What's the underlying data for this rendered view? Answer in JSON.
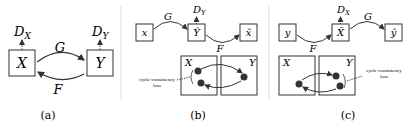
{
  "panels": [
    {
      "caption": "(a)",
      "nodes": {
        "x": "X",
        "y": "Y"
      },
      "discriminators": {
        "dx_base": "D",
        "dx_sub": "X",
        "dy_base": "D",
        "dy_sub": "Y"
      },
      "edges": {
        "forward": "G",
        "backward": "F"
      }
    },
    {
      "caption": "(b)",
      "chain": {
        "start": "x",
        "mid": "Ŷ",
        "end": "x̂"
      },
      "edges": {
        "forward": "G",
        "backward": "F"
      },
      "discriminator": {
        "base": "D",
        "sub": "Y"
      },
      "domains": {
        "left": "X",
        "right": "Y"
      },
      "loss_label": [
        "cycle-consistency",
        "loss"
      ]
    },
    {
      "caption": "(c)",
      "chain": {
        "start": "y",
        "mid": "X̂",
        "end": "ŷ"
      },
      "edges": {
        "forward": "F",
        "backward": "G"
      },
      "discriminator": {
        "base": "D",
        "sub": "X"
      },
      "domains": {
        "left": "X",
        "right": "Y"
      },
      "loss_label": [
        "cycle-consistency",
        "loss"
      ]
    }
  ],
  "colors": {
    "stroke": "#333333",
    "dot": "#333333",
    "divider": "#dddddd"
  }
}
